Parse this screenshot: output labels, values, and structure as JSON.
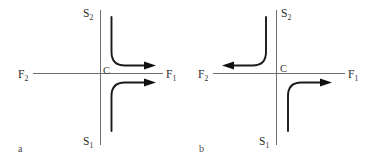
{
  "figure": {
    "caption_labels": [
      "a",
      "b"
    ],
    "background_color": "#ffffff",
    "axis_color": "#6f6f6f",
    "curve_color": "#1a1a1a",
    "label_color": "#2b2b2b"
  },
  "panels": [
    {
      "id": "a",
      "panel_label": "a",
      "center_label": "C",
      "axes": {
        "horizontal_left_label": "F",
        "horizontal_left_sub": "2",
        "horizontal_right_label": "F",
        "horizontal_right_sub": "1",
        "vertical_top_label": "S",
        "vertical_top_sub": "2",
        "vertical_bottom_label": "S",
        "vertical_bottom_sub": "1"
      },
      "trajectories": [
        {
          "name": "upper-curve",
          "from": "S2",
          "to": "F1",
          "arrow_direction": "right",
          "quadrant": "upper-right"
        },
        {
          "name": "lower-curve",
          "from": "S1",
          "to": "F1",
          "arrow_direction": "right",
          "quadrant": "lower-right"
        }
      ]
    },
    {
      "id": "b",
      "panel_label": "b",
      "center_label": "C",
      "axes": {
        "horizontal_left_label": "F",
        "horizontal_left_sub": "2",
        "horizontal_right_label": "F",
        "horizontal_right_sub": "1",
        "vertical_top_label": "S",
        "vertical_top_sub": "2",
        "vertical_bottom_label": "S",
        "vertical_bottom_sub": "1"
      },
      "trajectories": [
        {
          "name": "upper-curve",
          "from": "S2",
          "to": "F2",
          "arrow_direction": "left",
          "quadrant": "upper-left"
        },
        {
          "name": "lower-curve",
          "from": "S1",
          "to": "F1",
          "arrow_direction": "right",
          "quadrant": "lower-right"
        }
      ]
    }
  ]
}
